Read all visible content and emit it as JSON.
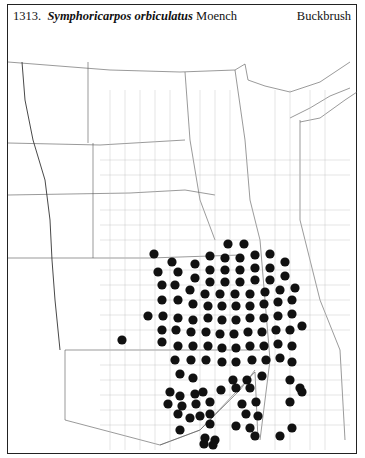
{
  "header": {
    "number": "1313.",
    "genus_species": "Symphoricarpos orbiculatus",
    "author": "Moench",
    "common_name": "Buckbrush"
  },
  "map": {
    "description": "County distribution map, Great Plains region",
    "dot_color": "#111111",
    "dots": [
      [
        228,
        244
      ],
      [
        244,
        244
      ],
      [
        154,
        254
      ],
      [
        210,
        256
      ],
      [
        225,
        258
      ],
      [
        240,
        258
      ],
      [
        255,
        255
      ],
      [
        270,
        254
      ],
      [
        172,
        262
      ],
      [
        195,
        264
      ],
      [
        210,
        270
      ],
      [
        225,
        270
      ],
      [
        240,
        270
      ],
      [
        255,
        268
      ],
      [
        270,
        268
      ],
      [
        285,
        262
      ],
      [
        158,
        272
      ],
      [
        178,
        272
      ],
      [
        195,
        278
      ],
      [
        210,
        282
      ],
      [
        225,
        282
      ],
      [
        240,
        282
      ],
      [
        255,
        280
      ],
      [
        270,
        280
      ],
      [
        285,
        276
      ],
      [
        162,
        285
      ],
      [
        175,
        285
      ],
      [
        190,
        290
      ],
      [
        205,
        294
      ],
      [
        220,
        294
      ],
      [
        235,
        294
      ],
      [
        250,
        294
      ],
      [
        265,
        292
      ],
      [
        280,
        290
      ],
      [
        295,
        288
      ],
      [
        162,
        300
      ],
      [
        178,
        300
      ],
      [
        193,
        304
      ],
      [
        208,
        306
      ],
      [
        222,
        306
      ],
      [
        236,
        306
      ],
      [
        250,
        306
      ],
      [
        264,
        304
      ],
      [
        278,
        302
      ],
      [
        292,
        300
      ],
      [
        148,
        316
      ],
      [
        163,
        316
      ],
      [
        178,
        318
      ],
      [
        193,
        320
      ],
      [
        208,
        318
      ],
      [
        222,
        320
      ],
      [
        236,
        320
      ],
      [
        250,
        318
      ],
      [
        264,
        318
      ],
      [
        278,
        316
      ],
      [
        292,
        314
      ],
      [
        162,
        330
      ],
      [
        176,
        330
      ],
      [
        191,
        332
      ],
      [
        206,
        332
      ],
      [
        220,
        334
      ],
      [
        234,
        334
      ],
      [
        248,
        332
      ],
      [
        262,
        332
      ],
      [
        276,
        330
      ],
      [
        290,
        330
      ],
      [
        302,
        326
      ],
      [
        122,
        340
      ],
      [
        162,
        342
      ],
      [
        178,
        346
      ],
      [
        193,
        346
      ],
      [
        208,
        346
      ],
      [
        222,
        348
      ],
      [
        236,
        348
      ],
      [
        250,
        346
      ],
      [
        264,
        346
      ],
      [
        278,
        344
      ],
      [
        292,
        346
      ],
      [
        175,
        360
      ],
      [
        191,
        360
      ],
      [
        206,
        360
      ],
      [
        222,
        362
      ],
      [
        236,
        362
      ],
      [
        252,
        360
      ],
      [
        266,
        360
      ],
      [
        280,
        358
      ],
      [
        292,
        362
      ],
      [
        180,
        374
      ],
      [
        193,
        378
      ],
      [
        233,
        380
      ],
      [
        247,
        380
      ],
      [
        262,
        376
      ],
      [
        290,
        380
      ],
      [
        300,
        388
      ],
      [
        170,
        392
      ],
      [
        180,
        396
      ],
      [
        195,
        394
      ],
      [
        203,
        392
      ],
      [
        221,
        390
      ],
      [
        236,
        388
      ],
      [
        250,
        388
      ],
      [
        302,
        392
      ],
      [
        168,
        404
      ],
      [
        182,
        406
      ],
      [
        196,
        404
      ],
      [
        210,
        402
      ],
      [
        242,
        404
      ],
      [
        256,
        402
      ],
      [
        290,
        402
      ],
      [
        178,
        414
      ],
      [
        190,
        418
      ],
      [
        200,
        416
      ],
      [
        210,
        414
      ],
      [
        246,
        414
      ],
      [
        258,
        416
      ],
      [
        180,
        430
      ],
      [
        210,
        424
      ],
      [
        236,
        426
      ],
      [
        250,
        428
      ],
      [
        292,
        428
      ],
      [
        280,
        436
      ],
      [
        205,
        438
      ],
      [
        215,
        440
      ],
      [
        255,
        436
      ],
      [
        204,
        444
      ],
      [
        213,
        445
      ]
    ]
  }
}
